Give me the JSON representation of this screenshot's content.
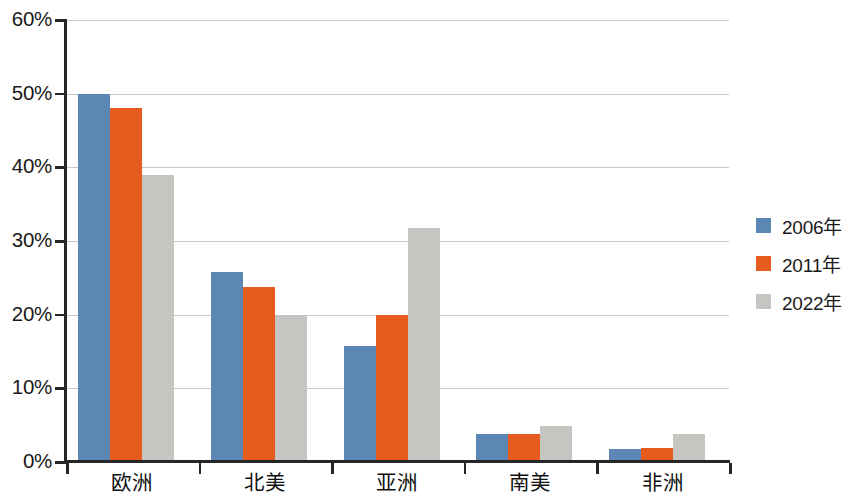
{
  "chart_data": {
    "type": "bar",
    "title": "",
    "subtitle": "",
    "xlabel": "",
    "ylabel": "",
    "categories": [
      "欧洲",
      "北美",
      "亚洲",
      "南美",
      "非洲"
    ],
    "series": [
      {
        "name": "2006年",
        "color": "#5c87b4",
        "values": [
          50.0,
          25.8,
          15.8,
          3.8,
          1.8
        ]
      },
      {
        "name": "2011年",
        "color": "#e65c1f",
        "values": [
          48.0,
          23.8,
          19.9,
          3.8,
          1.9
        ]
      },
      {
        "name": "2022年",
        "color": "#c5c5c1",
        "values": [
          38.9,
          20.0,
          31.7,
          4.9,
          3.8
        ]
      }
    ],
    "ylim": [
      0,
      60
    ],
    "ytick_values": [
      0,
      10,
      20,
      30,
      40,
      50,
      60
    ],
    "ytick_labels": [
      "0%",
      "10%",
      "20%",
      "30%",
      "40%",
      "50%",
      "60%"
    ],
    "grid": true,
    "grid_axis": "y",
    "legend_position": "right",
    "value_format": "percent"
  },
  "axes": {
    "axis_color": "#262626",
    "grid_color": "#c9c9c9",
    "label_color": "#1a1a1a"
  },
  "legend": {
    "entries": [
      {
        "label": "2006年",
        "color": "#5c87b4"
      },
      {
        "label": "2011年",
        "color": "#e65c1f"
      },
      {
        "label": "2022年",
        "color": "#c5c5c1"
      }
    ]
  }
}
